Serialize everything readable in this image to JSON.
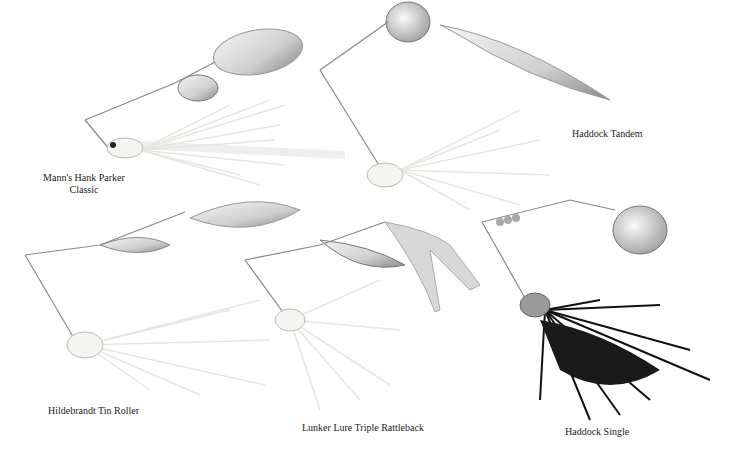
{
  "lures": [
    {
      "name": "Mann's Hank Parker Classic",
      "line1": "Mann's Hank Parker",
      "line2": "Classic",
      "skirt_color": "#f2f2ee"
    },
    {
      "name": "Haddock Tandem",
      "skirt_color": "#f2f2ee"
    },
    {
      "name": "Hildebrandt Tin Roller",
      "skirt_color": "#eeeeea"
    },
    {
      "name": "Lunker Lure Triple Rattleback",
      "skirt_color": "#f0f0ec"
    },
    {
      "name": "Haddock Single",
      "skirt_color": "#111111"
    }
  ],
  "colors": {
    "background": "#ffffff",
    "blade": "#c8c8c8",
    "wire": "#888888",
    "text": "#222222"
  }
}
